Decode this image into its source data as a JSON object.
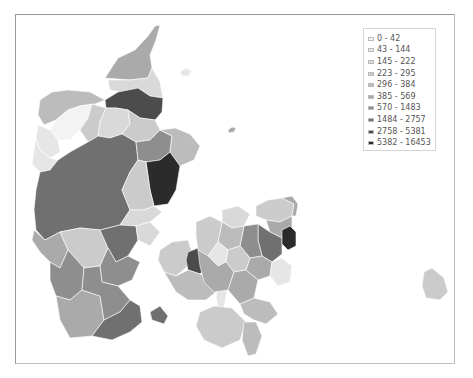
{
  "map": {
    "title": "",
    "type": "choropleth",
    "subject": "Denmark municipalities",
    "legend": {
      "placement": "top-right",
      "items": [
        {
          "label": "0 - 42",
          "color": "#f3f3f3"
        },
        {
          "label": "43 - 144",
          "color": "#e6e6e6"
        },
        {
          "label": "145 - 222",
          "color": "#d9d9d9"
        },
        {
          "label": "223 - 295",
          "color": "#cbcbcb"
        },
        {
          "label": "296 - 384",
          "color": "#bcbcbc"
        },
        {
          "label": "385 - 569",
          "color": "#aaaaaa"
        },
        {
          "label": "570 - 1483",
          "color": "#8e8e8e"
        },
        {
          "label": "1484 - 2757",
          "color": "#707070"
        },
        {
          "label": "2758 - 5381",
          "color": "#4c4c4c"
        },
        {
          "label": "5382 - 16453",
          "color": "#2b2b2b"
        }
      ]
    },
    "regions": [
      {
        "name": "north-tip",
        "class": 5
      },
      {
        "name": "north-east",
        "class": 2
      },
      {
        "name": "aalborg",
        "class": 8
      },
      {
        "name": "thy-west",
        "class": 4
      },
      {
        "name": "limfjord-islands",
        "class": 0
      },
      {
        "name": "mors",
        "class": 1
      },
      {
        "name": "vesthimmerland",
        "class": 3
      },
      {
        "name": "rebild",
        "class": 2
      },
      {
        "name": "mariagerfjord",
        "class": 3
      },
      {
        "name": "west-coast",
        "class": 1
      },
      {
        "name": "central-jutland",
        "class": 7
      },
      {
        "name": "randers",
        "class": 6
      },
      {
        "name": "djursland",
        "class": 4
      },
      {
        "name": "aarhus",
        "class": 9
      },
      {
        "name": "skanderborg",
        "class": 3
      },
      {
        "name": "horsens",
        "class": 2
      },
      {
        "name": "west-south",
        "class": 5
      },
      {
        "name": "vejle",
        "class": 3
      },
      {
        "name": "billund",
        "class": 7
      },
      {
        "name": "kolding",
        "class": 6
      },
      {
        "name": "fredericia",
        "class": 2
      },
      {
        "name": "esbjerg",
        "class": 6
      },
      {
        "name": "tonder",
        "class": 5
      },
      {
        "name": "aabenraa",
        "class": 6
      },
      {
        "name": "sonderborg-als",
        "class": 7
      },
      {
        "name": "funen-west",
        "class": 3
      },
      {
        "name": "odense",
        "class": 8
      },
      {
        "name": "funen-east",
        "class": 1
      },
      {
        "name": "funen-south",
        "class": 4
      },
      {
        "name": "langeland",
        "class": 1
      },
      {
        "name": "north-zealand",
        "class": 3
      },
      {
        "name": "helsingor",
        "class": 5
      },
      {
        "name": "hillerod",
        "class": 5
      },
      {
        "name": "copenhagen-suburbs",
        "class": 7
      },
      {
        "name": "copenhagen",
        "class": 9
      },
      {
        "name": "roskilde",
        "class": 6
      },
      {
        "name": "odsherred",
        "class": 2
      },
      {
        "name": "holbaek",
        "class": 4
      },
      {
        "name": "kalundborg",
        "class": 3
      },
      {
        "name": "sorø",
        "class": 1
      },
      {
        "name": "ringsted",
        "class": 3
      },
      {
        "name": "koge",
        "class": 5
      },
      {
        "name": "stevns",
        "class": 1
      },
      {
        "name": "slagelse",
        "class": 5
      },
      {
        "name": "naestved",
        "class": 5
      },
      {
        "name": "vordingborg",
        "class": 4
      },
      {
        "name": "lolland",
        "class": 3
      },
      {
        "name": "falster",
        "class": 4
      },
      {
        "name": "bornholm",
        "class": 3
      },
      {
        "name": "anholt",
        "class": 5
      },
      {
        "name": "laeso",
        "class": 1
      }
    ]
  }
}
